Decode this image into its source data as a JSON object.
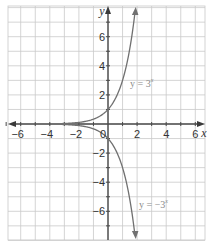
{
  "chart_data": {
    "type": "line",
    "title": "",
    "xlabel": "x",
    "ylabel": "y",
    "xlim": [
      -7,
      6.7
    ],
    "ylim": [
      -8,
      8
    ],
    "grid": true,
    "x_ticks": [
      -6,
      -4,
      -2,
      0,
      2,
      4,
      6
    ],
    "y_ticks": [
      -6,
      -4,
      -2,
      2,
      4,
      6
    ],
    "x_tick_labels": [
      "−6",
      "−4",
      "−2",
      "0",
      "2",
      "4",
      "6"
    ],
    "y_tick_labels": [
      "−6",
      "−4",
      "−2",
      "2",
      "4",
      "6"
    ],
    "series": [
      {
        "name": "y = 3^x",
        "label": "y = 3",
        "label_exponent": "x",
        "x": [
          -3,
          -2,
          -1,
          0,
          1,
          1.5,
          1.9
        ],
        "y": [
          0.037,
          0.111,
          0.333,
          1,
          3,
          5.196,
          8.06
        ],
        "color": "#707070"
      },
      {
        "name": "y = −3^x",
        "label": "y = −3",
        "label_exponent": "x",
        "x": [
          -3,
          -2,
          -1,
          0,
          1,
          1.5,
          1.9
        ],
        "y": [
          -0.037,
          -0.111,
          -0.333,
          -1,
          -3,
          -5.196,
          -8.06
        ],
        "color": "#707070"
      }
    ],
    "annotations": [
      {
        "text": "y = 3^x",
        "x": 1.6,
        "y": 3
      },
      {
        "text": "y = −3^x",
        "x": 2.2,
        "y": -5.5
      }
    ]
  }
}
